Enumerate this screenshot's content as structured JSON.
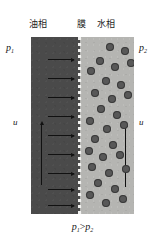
{
  "figure": {
    "title_labels": {
      "oil_phase": "油相",
      "membrane": "膜",
      "water_phase": "水相"
    },
    "side_labels": {
      "p1": "p",
      "p1_sub": "1",
      "p2": "p",
      "p2_sub": "2",
      "u_left": "u",
      "u_right": "u"
    },
    "caption": {
      "p1": "p",
      "p1_sub": "1",
      "gt": ">",
      "p2": "p",
      "p2_sub": "2",
      "full_text": "p1>p2"
    },
    "colors": {
      "oil_phase_fill": "#4a4a4a",
      "water_phase_fill": "#b5b5b2",
      "membrane_dash": "#f2f2f0",
      "droplet_fill": "#585858",
      "arrow_stroke": "#111111",
      "background": "#ffffff",
      "text": "#151515"
    },
    "panel": {
      "x": 31,
      "y": 37,
      "width": 103,
      "height": 177,
      "membrane_x": 48
    },
    "flow_arrows_horizontal": [
      {
        "x": 17,
        "y": 22,
        "length": 26
      },
      {
        "x": 17,
        "y": 41,
        "length": 26
      },
      {
        "x": 17,
        "y": 60,
        "length": 26
      },
      {
        "x": 17,
        "y": 79,
        "length": 26
      },
      {
        "x": 17,
        "y": 98,
        "length": 26
      },
      {
        "x": 17,
        "y": 117,
        "length": 26
      },
      {
        "x": 17,
        "y": 136,
        "length": 26
      },
      {
        "x": 17,
        "y": 152,
        "length": 26
      },
      {
        "x": 17,
        "y": 168,
        "length": 26
      }
    ],
    "velocity_arrows_vertical": [
      {
        "x": 10,
        "y": 88,
        "length": 60,
        "phase": "oil"
      },
      {
        "x": 94,
        "y": 90,
        "length": 60,
        "phase": "water"
      }
    ],
    "droplets": [
      {
        "x": 31,
        "y": 10,
        "r": 4
      },
      {
        "x": 46,
        "y": 14,
        "r": 4
      },
      {
        "x": 21,
        "y": 24,
        "r": 4
      },
      {
        "x": 36,
        "y": 30,
        "r": 4
      },
      {
        "x": 52,
        "y": 26,
        "r": 4
      },
      {
        "x": 12,
        "y": 34,
        "r": 4
      },
      {
        "x": 27,
        "y": 44,
        "r": 4
      },
      {
        "x": 42,
        "y": 48,
        "r": 4
      },
      {
        "x": 16,
        "y": 56,
        "r": 4
      },
      {
        "x": 33,
        "y": 62,
        "r": 4
      },
      {
        "x": 49,
        "y": 58,
        "r": 4
      },
      {
        "x": 22,
        "y": 72,
        "r": 4
      },
      {
        "x": 38,
        "y": 78,
        "r": 4
      },
      {
        "x": 11,
        "y": 84,
        "r": 4
      },
      {
        "x": 28,
        "y": 92,
        "r": 4
      },
      {
        "x": 45,
        "y": 88,
        "r": 4
      },
      {
        "x": 16,
        "y": 102,
        "r": 4
      },
      {
        "x": 34,
        "y": 108,
        "r": 4
      },
      {
        "x": 10,
        "y": 114,
        "r": 4
      },
      {
        "x": 24,
        "y": 120,
        "r": 4
      },
      {
        "x": 41,
        "y": 118,
        "r": 4
      },
      {
        "x": 13,
        "y": 130,
        "r": 4
      },
      {
        "x": 30,
        "y": 136,
        "r": 4
      },
      {
        "x": 47,
        "y": 132,
        "r": 4
      },
      {
        "x": 19,
        "y": 146,
        "r": 4
      },
      {
        "x": 36,
        "y": 152,
        "r": 4
      },
      {
        "x": 11,
        "y": 158,
        "r": 4
      },
      {
        "x": 27,
        "y": 166,
        "r": 4
      },
      {
        "x": 44,
        "y": 162,
        "r": 4
      }
    ]
  }
}
